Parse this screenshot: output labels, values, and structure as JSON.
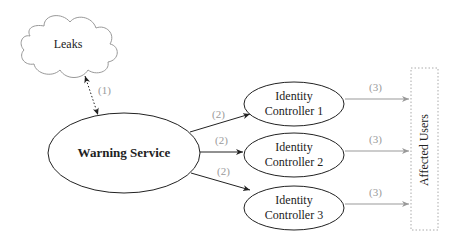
{
  "diagram": {
    "nodes": {
      "leaks": {
        "label": "Leaks",
        "shape": "cloud"
      },
      "warning_service": {
        "label": "Warning Service",
        "shape": "ellipse"
      },
      "controllers": [
        {
          "line1": "Identity",
          "line2": "Controller 1"
        },
        {
          "line1": "Identity",
          "line2": "Controller 2"
        },
        {
          "line1": "Identity",
          "line2": "Controller 3"
        }
      ],
      "affected_users": {
        "label": "Affected Users",
        "shape": "dotted-rectangle"
      }
    },
    "edges": {
      "leaks_ws": {
        "label": "(1)",
        "style": "dotted-bidirectional"
      },
      "ws_to_controllers": [
        {
          "label": "(2)"
        },
        {
          "label": "(2)"
        },
        {
          "label": "(2)"
        }
      ],
      "controllers_to_users": [
        {
          "label": "(3)"
        },
        {
          "label": "(3)"
        },
        {
          "label": "(3)"
        }
      ]
    },
    "colors": {
      "node_stroke": "#222222",
      "cloud_stroke": "#999999",
      "label_gray": "#9a9a9a",
      "gray_arrow": "#999999"
    }
  }
}
